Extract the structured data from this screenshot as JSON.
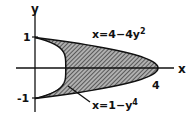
{
  "figure": {
    "axes": {
      "x_label": "x",
      "y_label": "y",
      "x_ticks": [
        {
          "value": 4,
          "label": "4"
        }
      ],
      "y_ticks": [
        {
          "value": 1,
          "label": "1"
        },
        {
          "value": -1,
          "label": "-1"
        }
      ],
      "x_range": [
        -0.3,
        4.8
      ],
      "y_range": [
        -1.3,
        1.7
      ]
    },
    "curves": [
      {
        "name": "outer",
        "equation": "x=4-4y²",
        "label": "x=4−4y",
        "superscript": "2"
      },
      {
        "name": "inner",
        "equation": "x=1-y⁴",
        "label": "x=1−y",
        "superscript": "4"
      }
    ],
    "region": {
      "description": "Shaded region between x=1-y^4 and x=4-4y^2 for -1 ≤ y ≤ 1",
      "fill": "#7a7a7a"
    },
    "colors": {
      "ink": "#111111",
      "shade": "#8a8a8a",
      "background": "#ffffff"
    }
  }
}
